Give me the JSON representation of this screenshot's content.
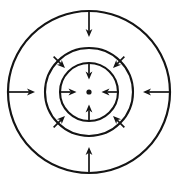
{
  "figure": {
    "background_color": "#ffffff",
    "line_color": "#141414",
    "canvas": {
      "width": 178,
      "height": 185
    },
    "center": {
      "x": 89,
      "y": 92,
      "dot_radius": 2.6
    },
    "circles": [
      {
        "id": "outer-circle",
        "r": 81,
        "stroke_width": 2.2
      },
      {
        "id": "middle-circle",
        "r": 44,
        "stroke_width": 2.1
      },
      {
        "id": "inner-circle",
        "r": 29,
        "stroke_width": 2.1
      }
    ],
    "arrow_stroke_width": 1.7,
    "arrowhead": {
      "length": 8,
      "half_width": 3.4,
      "notch": 0.72
    },
    "arrow_direction": "inward",
    "arrows": [
      {
        "id": "outer-top-arrow",
        "angle_deg": 90,
        "tail_r": 81,
        "tip_r": 55
      },
      {
        "id": "outer-bottom-arrow",
        "angle_deg": 270,
        "tail_r": 81,
        "tip_r": 55
      },
      {
        "id": "outer-left-arrow",
        "angle_deg": 180,
        "tail_r": 82,
        "tip_r": 54
      },
      {
        "id": "outer-right-arrow",
        "angle_deg": 0,
        "tail_r": 82,
        "tip_r": 54
      },
      {
        "id": "middle-upper-left-arrow",
        "angle_deg": 135,
        "tail_r": 50,
        "tip_r": 34
      },
      {
        "id": "middle-upper-right-arrow",
        "angle_deg": 45,
        "tail_r": 50,
        "tip_r": 34
      },
      {
        "id": "middle-lower-left-arrow",
        "angle_deg": 225,
        "tail_r": 50,
        "tip_r": 34
      },
      {
        "id": "middle-lower-right-arrow",
        "angle_deg": 315,
        "tail_r": 50,
        "tip_r": 34
      },
      {
        "id": "inner-top-arrow",
        "angle_deg": 90,
        "tail_r": 29,
        "tip_r": 12.5
      },
      {
        "id": "inner-bottom-arrow",
        "angle_deg": 270,
        "tail_r": 29,
        "tip_r": 12.5
      },
      {
        "id": "inner-left-arrow",
        "angle_deg": 180,
        "tail_r": 29,
        "tip_r": 12.5
      },
      {
        "id": "inner-right-arrow",
        "angle_deg": 0,
        "tail_r": 29,
        "tip_r": 12.5
      }
    ]
  }
}
